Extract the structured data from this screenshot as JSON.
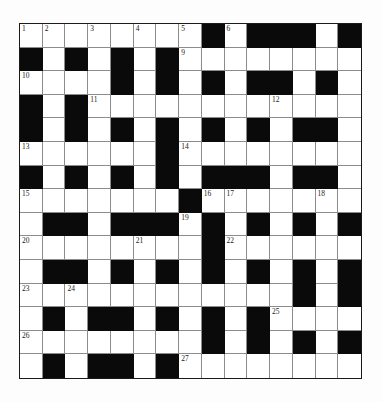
{
  "puzzle": {
    "rows": 15,
    "cols": 15,
    "colors": {
      "black": "#0a0a0a",
      "white": "#ffffff",
      "line": "#8c8c8c",
      "border": "#1a1a1a"
    },
    "grid": [
      "........#.###.#",
      "#.#.#.#........",
      "....#.#.#.##.#.",
      "#.#............",
      "#.#.#.#.#.#.##.",
      "......#........",
      "#.#.#.#.###.##.",
      ".......#.......",
      ".##.###.#.#.#.#",
      "........#......",
      ".##.#.#.#.#.#.#",
      "............#.#",
      ".#.##.#.#.#....",
      "........#.#.#.#",
      ".#.##.#........"
    ],
    "numbers": [
      {
        "r": 0,
        "c": 0,
        "n": "1"
      },
      {
        "r": 0,
        "c": 1,
        "n": "2"
      },
      {
        "r": 0,
        "c": 3,
        "n": "3"
      },
      {
        "r": 0,
        "c": 5,
        "n": "4"
      },
      {
        "r": 0,
        "c": 7,
        "n": "5"
      },
      {
        "r": 0,
        "c": 9,
        "n": "6"
      },
      {
        "r": 0,
        "c": 12,
        "n": "7"
      },
      {
        "r": 0,
        "c": 14,
        "n": "8"
      },
      {
        "r": 1,
        "c": 7,
        "n": "9"
      },
      {
        "r": 2,
        "c": 0,
        "n": "10"
      },
      {
        "r": 3,
        "c": 3,
        "n": "11"
      },
      {
        "r": 3,
        "c": 11,
        "n": "12"
      },
      {
        "r": 5,
        "c": 0,
        "n": "13"
      },
      {
        "r": 5,
        "c": 7,
        "n": "14"
      },
      {
        "r": 7,
        "c": 0,
        "n": "15"
      },
      {
        "r": 7,
        "c": 8,
        "n": "16"
      },
      {
        "r": 7,
        "c": 9,
        "n": "17"
      },
      {
        "r": 7,
        "c": 13,
        "n": "18"
      },
      {
        "r": 8,
        "c": 7,
        "n": "19"
      },
      {
        "r": 9,
        "c": 0,
        "n": "20"
      },
      {
        "r": 9,
        "c": 5,
        "n": "21"
      },
      {
        "r": 9,
        "c": 9,
        "n": "22"
      },
      {
        "r": 11,
        "c": 0,
        "n": "23"
      },
      {
        "r": 11,
        "c": 2,
        "n": "24"
      },
      {
        "r": 12,
        "c": 11,
        "n": "25"
      },
      {
        "r": 13,
        "c": 0,
        "n": "26"
      },
      {
        "r": 14,
        "c": 7,
        "n": "27"
      }
    ]
  }
}
